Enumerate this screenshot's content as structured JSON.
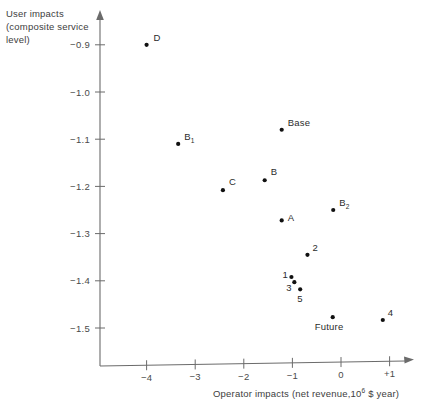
{
  "chart_data": {
    "type": "scatter",
    "title": "",
    "xlabel": "Operator impacts (net revenue,10⁶ $ year)",
    "xlabel_parts": {
      "before": "Operator impacts (net revenue,10",
      "exponent": "6",
      "after": " $ year)"
    },
    "ylabel": "User impacts (composite service level)",
    "ylabel_lines": [
      "User impacts",
      "(composite service",
      "level)"
    ],
    "xlim": [
      -4.85,
      1.55
    ],
    "ylim": [
      -1.57,
      -0.855
    ],
    "grid": false,
    "legend": "none",
    "xticks": [
      -4,
      -3,
      -2,
      -1,
      0,
      1
    ],
    "xticklabels": [
      "−4",
      "−3",
      "−2",
      "−1",
      "0",
      "+1"
    ],
    "yticks": [
      -0.9,
      -1.0,
      -1.1,
      -1.2,
      -1.3,
      -1.4,
      -1.5
    ],
    "yticklabels": [
      "−0.9",
      "−1.0",
      "−1.1",
      "−1.2",
      "−1.3",
      "−1.4",
      "−1.5"
    ],
    "points": [
      {
        "label": "D",
        "label_sub": "",
        "x": -4.0,
        "y": -0.9,
        "label_dx": 7,
        "label_dy": -4
      },
      {
        "label": "B",
        "label_sub": "1",
        "x": -3.35,
        "y": -1.11,
        "label_dx": 6,
        "label_dy": -4
      },
      {
        "label": "Base",
        "label_sub": "",
        "x": -1.22,
        "y": -1.08,
        "label_dx": 6,
        "label_dy": -4
      },
      {
        "label": "C",
        "label_sub": "",
        "x": -2.43,
        "y": -1.208,
        "label_dx": 6,
        "label_dy": -5
      },
      {
        "label": "B",
        "label_sub": "",
        "x": -1.57,
        "y": -1.187,
        "label_dx": 6,
        "label_dy": -5
      },
      {
        "label": "B",
        "label_sub": "2",
        "x": -0.16,
        "y": -1.25,
        "label_dx": 6,
        "label_dy": -4
      },
      {
        "label": "A",
        "label_sub": "",
        "x": -1.22,
        "y": -1.272,
        "label_dx": 6,
        "label_dy": 1
      },
      {
        "label": "2",
        "label_sub": "",
        "x": -0.69,
        "y": -1.345,
        "label_dx": 5,
        "label_dy": -4
      },
      {
        "label": "1",
        "label_sub": "",
        "x": -1.02,
        "y": -1.392,
        "label_dx": -9,
        "label_dy": 1
      },
      {
        "label": "3",
        "label_sub": "",
        "x": -0.96,
        "y": -1.403,
        "label_dx": -8,
        "label_dy": 9
      },
      {
        "label": "5",
        "label_sub": "",
        "x": -0.84,
        "y": -1.418,
        "label_dx": -3,
        "label_dy": 13
      },
      {
        "label": "Future",
        "label_sub": "",
        "x": -0.17,
        "y": -1.477,
        "label_dx": -18,
        "label_dy": 13
      },
      {
        "label": "4",
        "label_sub": "",
        "x": 0.86,
        "y": -1.483,
        "label_dx": 5,
        "label_dy": -4
      }
    ]
  },
  "colors": {
    "axis": "#6b6b6b",
    "marker": "#111111",
    "text": "#2b2b2b",
    "background": "#ffffff"
  }
}
